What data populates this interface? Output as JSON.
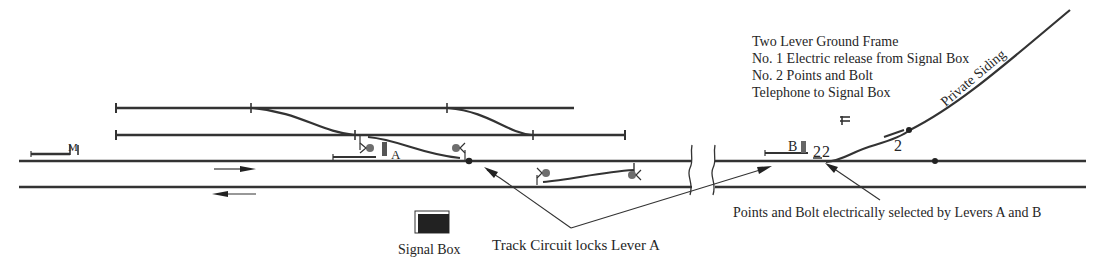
{
  "diagram": {
    "colors": {
      "track": "#333333",
      "signal_disc": "#6e6e6e",
      "box_fill": "#222222",
      "background": "#ffffff"
    }
  },
  "ground_frame_notes": [
    "Two Lever Ground Frame",
    "No. 1 Electric release from Signal Box",
    "No. 2 Points and Bolt",
    "Telephone to Signal Box"
  ],
  "labels": {
    "signal_m": "M",
    "lever_a": "A",
    "lever_b": "B",
    "lever_numbers_frame": "22",
    "lever_number_points": "2",
    "private_siding": "Private Siding",
    "signal_box": "Signal Box"
  },
  "annotations": {
    "track_circuit": "Track Circuit locks Lever A",
    "points_bolt": "Points and Bolt electrically selected by Levers A and B"
  },
  "icons": {
    "telephone": "telephone-icon",
    "signal_box": "signal-box-icon",
    "direction_up": "arrow-right-icon",
    "direction_down": "arrow-left-icon"
  }
}
